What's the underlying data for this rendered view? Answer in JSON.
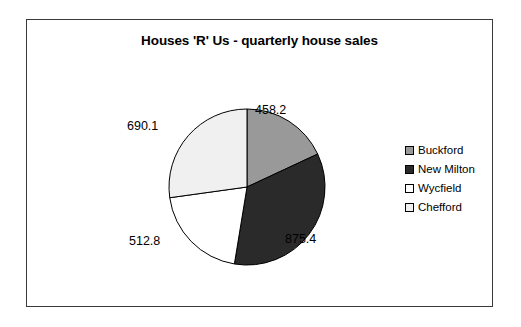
{
  "chart_data": {
    "type": "pie",
    "title": "Houses 'R' Us - quarterly house sales",
    "xlabel": "",
    "ylabel": "",
    "legend_position": "right",
    "grid": false,
    "total": 2536.5,
    "categories": [
      "Buckford",
      "New Milton",
      "Wycfield",
      "Chefford"
    ],
    "values": [
      458.2,
      875.4,
      512.8,
      690.1
    ],
    "slice_colors": [
      "#999999",
      "#2a2a2a",
      "#ffffff",
      "#f0f0f0"
    ],
    "slices": [
      {
        "label": "Buckford",
        "value": "458.2",
        "numeric": 458.2,
        "color": "#999999",
        "start_angle": 0.0,
        "end_angle": 65.0,
        "percent": 18.1
      },
      {
        "label": "New Milton",
        "value": "875.4",
        "numeric": 875.4,
        "color": "#2a2a2a",
        "start_angle": 65.0,
        "end_angle": 189.3,
        "percent": 34.5
      },
      {
        "label": "Wycfield",
        "value": "512.8",
        "numeric": 512.8,
        "color": "#ffffff",
        "start_angle": 189.3,
        "end_angle": 262.1,
        "percent": 20.2
      },
      {
        "label": "Chefford",
        "value": "690.1",
        "numeric": 690.1,
        "color": "#f0f0f0",
        "start_angle": 262.1,
        "end_angle": 360.0,
        "percent": 27.2
      }
    ]
  },
  "legend": {
    "items": [
      {
        "label": "Buckford",
        "color": "#999999"
      },
      {
        "label": "New Milton",
        "color": "#2a2a2a"
      },
      {
        "label": "Wycfield",
        "color": "#ffffff"
      },
      {
        "label": "Chefford",
        "color": "#f0f0f0"
      }
    ]
  },
  "style": {
    "frame_border": "#3a3a3a",
    "slice_outline": "#000000",
    "background": "#ffffff",
    "text_color": "#000000"
  }
}
